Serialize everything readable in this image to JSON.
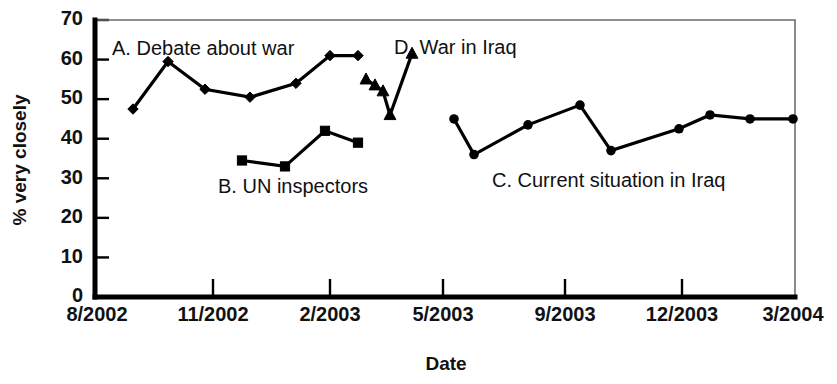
{
  "chart_data": {
    "type": "line",
    "title": "",
    "xlabel": "Date",
    "ylabel": "% very closely",
    "ylim": [
      0,
      70
    ],
    "ytick_values": [
      0,
      10,
      20,
      30,
      40,
      50,
      60,
      70
    ],
    "ytick_labels": [
      "0",
      "10",
      "20",
      "30",
      "40",
      "50",
      "60",
      "70"
    ],
    "xtick_labels": [
      "8/2002",
      "11/2002",
      "2/2003",
      "5/2003",
      "9/2003",
      "12/2003",
      "3/2004"
    ],
    "xtick_positions": [
      95,
      213,
      330,
      443,
      565,
      682,
      795
    ],
    "grid": false,
    "legend_position": "inline-annotations",
    "series": [
      {
        "name": "A. Debate about war",
        "key": "A",
        "marker": "diamond",
        "label_text": "A. Debate about war",
        "label_x": 112,
        "label_y": 55,
        "points": [
          {
            "x": 133,
            "y_value": 47.5
          },
          {
            "x": 168,
            "y_value": 59.5
          },
          {
            "x": 205,
            "y_value": 52.5
          },
          {
            "x": 250,
            "y_value": 50.5
          },
          {
            "x": 296,
            "y_value": 54.0
          },
          {
            "x": 330,
            "y_value": 61.0
          },
          {
            "x": 358,
            "y_value": 61.0
          }
        ]
      },
      {
        "name": "B. UN inspectors",
        "key": "B",
        "marker": "square",
        "label_text": "B. UN inspectors",
        "label_x": 218,
        "label_y": 193,
        "points": [
          {
            "x": 242,
            "y_value": 34.5
          },
          {
            "x": 285,
            "y_value": 33.0
          },
          {
            "x": 325,
            "y_value": 42.0
          },
          {
            "x": 358,
            "y_value": 39.0
          }
        ]
      },
      {
        "name": "D. War in Iraq",
        "key": "D",
        "marker": "triangle",
        "label_text": "D. War in Iraq",
        "label_x": 394,
        "label_y": 54,
        "points": [
          {
            "x": 366,
            "y_value": 55.0
          },
          {
            "x": 375,
            "y_value": 53.5
          },
          {
            "x": 383,
            "y_value": 52.0
          },
          {
            "x": 390,
            "y_value": 46.0
          },
          {
            "x": 412,
            "y_value": 61.5
          }
        ]
      },
      {
        "name": "C. Current situation in Iraq",
        "key": "C",
        "marker": "circle",
        "label_text": "C. Current situation in Iraq",
        "label_x": 492,
        "label_y": 187,
        "points": [
          {
            "x": 454,
            "y_value": 45.0
          },
          {
            "x": 474,
            "y_value": 36.0
          },
          {
            "x": 528,
            "y_value": 43.5
          },
          {
            "x": 580,
            "y_value": 48.5
          },
          {
            "x": 611,
            "y_value": 37.0
          },
          {
            "x": 679,
            "y_value": 42.5
          },
          {
            "x": 710,
            "y_value": 46.0
          },
          {
            "x": 750,
            "y_value": 45.0
          },
          {
            "x": 793,
            "y_value": 45.0
          }
        ]
      }
    ],
    "plot_area": {
      "left": 95,
      "right": 795,
      "top": 20,
      "bottom": 297
    },
    "colors": {
      "line": "#000000",
      "frame": "#6b6b6b",
      "axis": "#000000",
      "text": "#111111"
    }
  }
}
